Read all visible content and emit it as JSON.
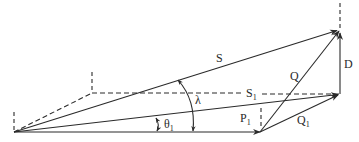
{
  "diagram": {
    "type": "vector-diagram",
    "stroke_color": "#2a2a2a",
    "background": "#ffffff",
    "labels": {
      "S": "S",
      "S1_main": "S",
      "S1_sub": "1",
      "Q": "Q",
      "Q1_main": "Q",
      "Q1_sub": "1",
      "P1_main": "P",
      "P1_sub": "1",
      "D": "D",
      "lambda": "λ",
      "theta1_main": "θ",
      "theta1_sub": "1"
    },
    "points": {
      "origin": [
        14,
        132
      ],
      "p1_tip": [
        260,
        132
      ],
      "s1_tip": [
        340,
        94
      ],
      "s_tip": [
        340,
        30
      ],
      "dashed_corner": [
        92,
        93
      ]
    },
    "vectors": [
      {
        "name": "S",
        "from": "origin",
        "to": "s_tip",
        "style": "solid-arrow"
      },
      {
        "name": "S1",
        "from": "origin",
        "to": "s1_tip",
        "style": "solid-arrow"
      },
      {
        "name": "P1",
        "from": "origin",
        "to": "p1_tip",
        "style": "solid-arrow"
      },
      {
        "name": "Q",
        "from": "p1_tip",
        "to": "s_tip",
        "style": "solid-arrow"
      },
      {
        "name": "Q1",
        "from": "p1_tip",
        "to": "s1_tip",
        "style": "solid-arrow"
      },
      {
        "name": "D",
        "from": "s1_tip",
        "to": "s_tip",
        "style": "solid-arrow"
      }
    ],
    "angles": [
      {
        "name": "theta1",
        "between": [
          "P1",
          "S1"
        ]
      },
      {
        "name": "lambda",
        "between": [
          "P1",
          "S"
        ]
      }
    ]
  }
}
